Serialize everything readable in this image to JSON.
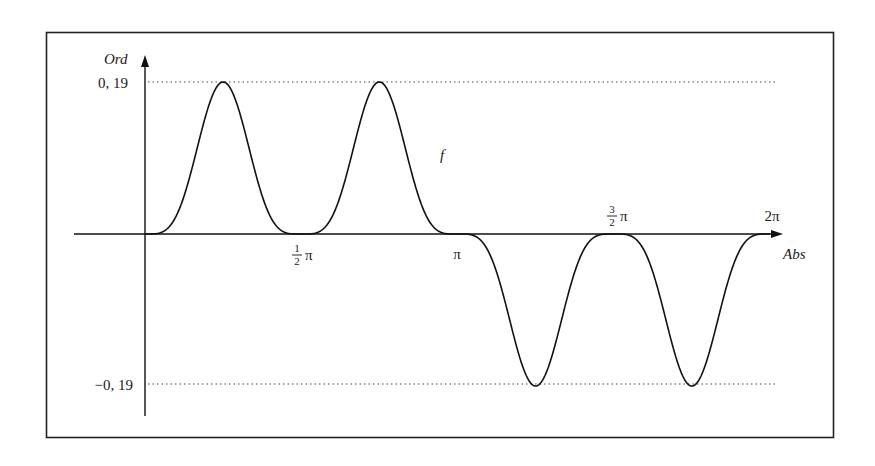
{
  "chart_data": {
    "type": "line",
    "title": "",
    "xlabel": "Abs",
    "ylabel": "Ord",
    "curve_label": "f",
    "x_ticks": [
      {
        "value": 0,
        "label": ""
      },
      {
        "value": 1.5708,
        "label_num": "1",
        "label_den": "2",
        "label_sym": "π",
        "position": "below"
      },
      {
        "value": 3.1416,
        "label": "π",
        "position": "below"
      },
      {
        "value": 4.7124,
        "label_num": "3",
        "label_den": "2",
        "label_sym": "π",
        "position": "above"
      },
      {
        "value": 6.2832,
        "label": "2π",
        "position": "above"
      }
    ],
    "y_ticks": [
      {
        "value": 0.19,
        "label": "0, 19"
      },
      {
        "value": -0.19,
        "label": "−0, 19"
      }
    ],
    "xlim": [
      0,
      6.2832
    ],
    "ylim": [
      -0.19,
      0.19
    ],
    "grid": false,
    "reference_lines": [
      0.19,
      -0.19
    ],
    "series": [
      {
        "name": "f",
        "x": [
          0,
          0.3927,
          0.7854,
          1.1781,
          1.5708,
          1.9635,
          2.3562,
          2.7489,
          3.1416,
          3.5343,
          3.927,
          4.3197,
          4.7124,
          5.1051,
          5.4978,
          5.8905,
          6.2832
        ],
        "values": [
          0,
          0.047,
          0.19,
          0.047,
          0,
          0.047,
          0.19,
          0.047,
          0,
          -0.047,
          -0.19,
          -0.047,
          0,
          -0.047,
          -0.19,
          -0.047,
          0
        ]
      }
    ]
  }
}
